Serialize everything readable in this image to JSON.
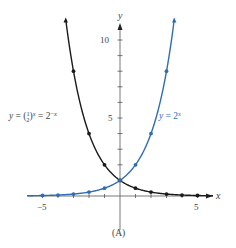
{
  "chart_data": {
    "type": "line",
    "title": "",
    "caption": "(A)",
    "xlabel": "x",
    "ylabel": "y",
    "xlim": [
      -6,
      6
    ],
    "ylim": [
      0,
      11.5
    ],
    "x_ticks": [
      -5,
      -4,
      -3,
      -2,
      -1,
      1,
      2,
      3,
      4,
      5
    ],
    "x_tick_labels": [
      {
        "value": -5,
        "label": "−5"
      },
      {
        "value": 5,
        "label": "5"
      }
    ],
    "y_ticks": [
      1,
      2,
      3,
      4,
      5,
      6,
      7,
      8,
      9,
      10
    ],
    "y_tick_labels": [
      {
        "value": 5,
        "label": "5"
      },
      {
        "value": 10,
        "label": "10"
      }
    ],
    "grid": false,
    "series": [
      {
        "name": "y = (1/2)^x = 2^-x",
        "label_text": "y = (½)ˣ = 2⁻ˣ",
        "color": "#1a1a1a",
        "base": 0.5,
        "domain": [
          -3.5,
          6
        ],
        "points": [
          {
            "x": -3,
            "y": 8
          },
          {
            "x": -2,
            "y": 4
          },
          {
            "x": -1,
            "y": 2
          },
          {
            "x": 0,
            "y": 1
          },
          {
            "x": 1,
            "y": 0.5
          },
          {
            "x": 2,
            "y": 0.25
          },
          {
            "x": 3,
            "y": 0.125
          },
          {
            "x": 4,
            "y": 0.0625
          },
          {
            "x": 5,
            "y": 0.03125
          }
        ]
      },
      {
        "name": "y = 2^x",
        "label_text": "y = 2ˣ",
        "color": "#2f6db5",
        "base": 2,
        "domain": [
          -6,
          3.5
        ],
        "points": [
          {
            "x": -5,
            "y": 0.03125
          },
          {
            "x": -4,
            "y": 0.0625
          },
          {
            "x": -3,
            "y": 0.125
          },
          {
            "x": -2,
            "y": 0.25
          },
          {
            "x": -1,
            "y": 0.5
          },
          {
            "x": 0,
            "y": 1
          },
          {
            "x": 1,
            "y": 2
          },
          {
            "x": 2,
            "y": 4
          },
          {
            "x": 3,
            "y": 8
          }
        ]
      }
    ],
    "colors": {
      "axis": "#555555",
      "text": "#333333"
    }
  },
  "labels": {
    "caption": "(A)",
    "x_axis": "x",
    "y_axis": "y",
    "tick_neg5": "−5",
    "tick_5x": "5",
    "tick_5y": "5",
    "tick_10y": "10",
    "series_black": "y = (",
    "series_blue": "y = 2"
  }
}
